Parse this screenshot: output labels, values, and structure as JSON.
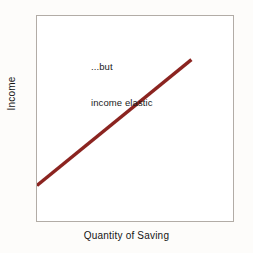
{
  "chart_data": {
    "type": "line",
    "title": "",
    "xlabel": "Quantity of Saving",
    "ylabel": "Income",
    "annotations": [
      {
        "text_line1": "...but",
        "text_line2": "income elastic"
      }
    ],
    "series": [
      {
        "name": "income elastic supply of saving",
        "color": "#8B2420",
        "x": [
          0,
          100
        ],
        "y": [
          0,
          100
        ],
        "points": [
          {
            "x": 0,
            "y": 0
          },
          {
            "x": 100,
            "y": 100
          }
        ]
      }
    ],
    "xlim": [
      0,
      100
    ],
    "ylim": [
      0,
      100
    ],
    "grid": false,
    "legend": false,
    "axis_ticks": false
  },
  "figure": {
    "background_color": "#fdfcfa",
    "plot_background_color": "#ffffff",
    "frame_color": "#b2aca6",
    "text_color": "#151515"
  },
  "labels": {
    "y_axis": "Income",
    "x_axis": "Quantity of Saving",
    "annotation_line_1": "...but",
    "annotation_line_2": "income elastic"
  }
}
